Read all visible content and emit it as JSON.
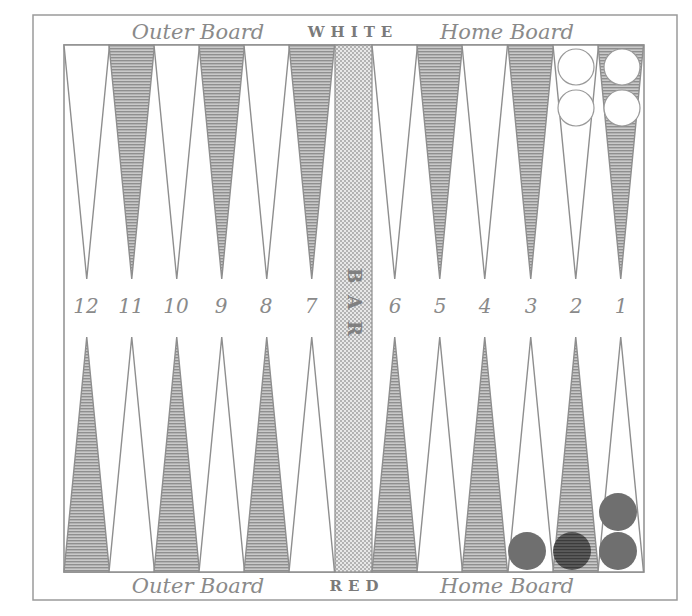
{
  "board": {
    "top_labels": {
      "left": "Outer Board",
      "center": "WHITE",
      "right": "Home Board"
    },
    "bottom_labels": {
      "left": "Outer Board",
      "center": "RED",
      "right": "Home Board"
    },
    "bar_label": "BAR",
    "point_numbers_left": [
      "12",
      "11",
      "10",
      "9",
      "8",
      "7"
    ],
    "point_numbers_right": [
      "6",
      "5",
      "4",
      "3",
      "2",
      "1"
    ],
    "top_row_pattern_left": [
      "white",
      "shaded",
      "white",
      "shaded",
      "white",
      "shaded"
    ],
    "top_row_pattern_right": [
      "white",
      "shaded",
      "white",
      "shaded",
      "white",
      "shaded"
    ],
    "bottom_row_pattern_left": [
      "shaded",
      "white",
      "shaded",
      "white",
      "shaded",
      "white"
    ],
    "bottom_row_pattern_right": [
      "shaded",
      "white",
      "shaded",
      "white",
      "shaded",
      "white"
    ],
    "colors": {
      "line": "#8e8e8e",
      "shading": "#9a9a9a",
      "bar_fill": "#d8d8d8",
      "red_checker": "#6f6f6f",
      "red_checker_dark": "#4a4a4a",
      "white_checker": "#ffffff"
    }
  },
  "checkers": {
    "white": [
      {
        "point": 2,
        "count": 2
      },
      {
        "point": 1,
        "count": 2
      }
    ],
    "red": [
      {
        "point": 3,
        "count": 1
      },
      {
        "point": 2,
        "count": 1
      },
      {
        "point": 1,
        "count": 2
      }
    ]
  }
}
